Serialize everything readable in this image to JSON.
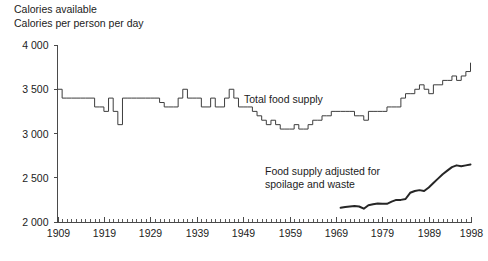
{
  "header": {
    "title_line1": "Calories available",
    "title_line2": "Calories per person per day"
  },
  "labels": {
    "total_food_supply": "Total food supply",
    "adjusted_line1": "Food supply adjusted for",
    "adjusted_line2": "spoilage and waste"
  },
  "axes": {
    "y_ticks": [
      "4 000",
      "3 500",
      "3 000",
      "2 500",
      "2 000"
    ],
    "x_ticks": [
      "1909",
      "1919",
      "1929",
      "1939",
      "1949",
      "1959",
      "1969",
      "1979",
      "1989",
      "1998"
    ]
  },
  "colors": {
    "axis": "#4a4a4a",
    "series_total": "#3d3d3d",
    "series_adjusted": "#262626",
    "text": "#1c1c1c",
    "background": "#ffffff"
  },
  "chart_data": {
    "type": "line",
    "title": "Calories available",
    "subtitle": "Calories per person per day",
    "xlabel": "",
    "ylabel": "Calories per person per day",
    "xlim": [
      1909,
      1998
    ],
    "ylim": [
      2000,
      4000
    ],
    "grid": false,
    "legend": "inline-annotations",
    "y_tick_values": [
      4000,
      3500,
      3000,
      2500,
      2000
    ],
    "x_tick_values": [
      1909,
      1919,
      1929,
      1939,
      1949,
      1959,
      1969,
      1979,
      1989,
      1998
    ],
    "series": [
      {
        "name": "Total food supply",
        "label_position": {
          "x": 1948,
          "y": 3530
        },
        "x": [
          1909,
          1910,
          1911,
          1912,
          1913,
          1914,
          1915,
          1916,
          1917,
          1918,
          1919,
          1920,
          1921,
          1922,
          1923,
          1924,
          1925,
          1926,
          1927,
          1928,
          1929,
          1930,
          1931,
          1932,
          1933,
          1934,
          1935,
          1936,
          1937,
          1938,
          1939,
          1940,
          1941,
          1942,
          1943,
          1944,
          1945,
          1946,
          1947,
          1948,
          1949,
          1950,
          1951,
          1952,
          1953,
          1954,
          1955,
          1956,
          1957,
          1958,
          1959,
          1960,
          1961,
          1962,
          1963,
          1964,
          1965,
          1966,
          1967,
          1968,
          1969,
          1970,
          1971,
          1972,
          1973,
          1974,
          1975,
          1976,
          1977,
          1978,
          1979,
          1980,
          1981,
          1982,
          1983,
          1984,
          1985,
          1986,
          1987,
          1988,
          1989,
          1990,
          1991,
          1992,
          1993,
          1994,
          1995,
          1996,
          1997,
          1998
        ],
        "y": [
          3500,
          3400,
          3400,
          3400,
          3400,
          3400,
          3400,
          3400,
          3300,
          3300,
          3250,
          3400,
          3250,
          3100,
          3400,
          3400,
          3400,
          3400,
          3400,
          3400,
          3400,
          3400,
          3350,
          3300,
          3300,
          3300,
          3400,
          3500,
          3400,
          3400,
          3400,
          3300,
          3300,
          3400,
          3300,
          3300,
          3400,
          3500,
          3400,
          3300,
          3300,
          3300,
          3250,
          3200,
          3150,
          3100,
          3150,
          3100,
          3050,
          3050,
          3050,
          3100,
          3050,
          3050,
          3100,
          3150,
          3150,
          3200,
          3200,
          3250,
          3250,
          3250,
          3250,
          3250,
          3200,
          3200,
          3150,
          3250,
          3250,
          3250,
          3250,
          3300,
          3300,
          3300,
          3400,
          3450,
          3450,
          3500,
          3550,
          3500,
          3450,
          3550,
          3550,
          3600,
          3600,
          3650,
          3600,
          3650,
          3700,
          3800
        ]
      },
      {
        "name": "Food supply adjusted for spoilage and waste",
        "label_position": {
          "x": 1974,
          "y": 2640
        },
        "x": [
          1970,
          1971,
          1972,
          1973,
          1974,
          1975,
          1976,
          1977,
          1978,
          1979,
          1980,
          1981,
          1982,
          1983,
          1984,
          1985,
          1986,
          1987,
          1988,
          1989,
          1990,
          1991,
          1992,
          1993,
          1994,
          1995,
          1996,
          1997,
          1998
        ],
        "y": [
          2160,
          2170,
          2175,
          2180,
          2175,
          2150,
          2190,
          2200,
          2210,
          2205,
          2205,
          2230,
          2250,
          2250,
          2260,
          2330,
          2350,
          2360,
          2350,
          2390,
          2440,
          2490,
          2540,
          2580,
          2620,
          2640,
          2630,
          2640,
          2650
        ]
      }
    ]
  }
}
